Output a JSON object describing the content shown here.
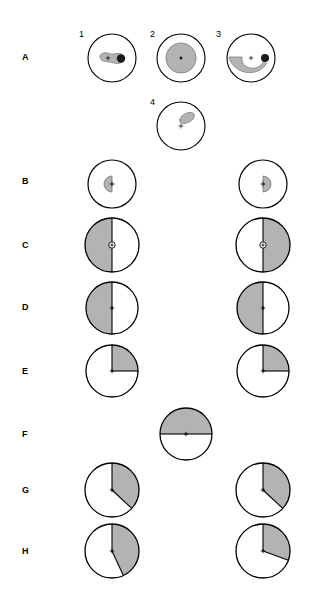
{
  "figure": {
    "background_color": "#ffffff",
    "outline_color": "#000000",
    "fill_gray": "#b3b3b3",
    "dot_color": "#1a1a1a",
    "width": 312,
    "height": 597
  },
  "row_labels": [
    {
      "id": "A",
      "label": "A",
      "y": 57
    },
    {
      "id": "B",
      "label": "B",
      "y": 181
    },
    {
      "id": "C",
      "label": "C",
      "y": 245
    },
    {
      "id": "D",
      "label": "D",
      "y": 307
    },
    {
      "id": "E",
      "label": "E",
      "y": 371
    },
    {
      "id": "F",
      "label": "F",
      "y": 434
    },
    {
      "id": "G",
      "label": "G",
      "y": 490
    },
    {
      "id": "H",
      "label": "H",
      "y": 551
    }
  ],
  "panel_numbers": [
    {
      "label": "1",
      "x": 79,
      "y": 30
    },
    {
      "label": "2",
      "x": 150,
      "y": 30
    },
    {
      "label": "3",
      "x": 216,
      "y": 30
    },
    {
      "label": "4",
      "x": 150,
      "y": 98
    }
  ],
  "chart_data": {
    "type": "diagram",
    "gray_fill": "#b3b3b3",
    "panels": [
      {
        "row": "A",
        "column": "1",
        "number": "1",
        "cx": 112,
        "cy": 58,
        "r": 24,
        "shape": "blob-with-dot",
        "fill_fraction": 0.09,
        "notes": "Tadpole / comet shaped gray blob with black dot at right end; center cross marker"
      },
      {
        "row": "A",
        "column": "2",
        "number": "2",
        "cx": 181,
        "cy": 58,
        "r": 24,
        "shape": "concentric-disc",
        "fill_fraction": 0.42,
        "notes": "Large gray disc concentric with outline; center dot"
      },
      {
        "row": "A",
        "column": "3",
        "number": "3",
        "cx": 251,
        "cy": 58,
        "r": 24,
        "shape": "crescent-with-dot",
        "fill_fraction": 0.22,
        "notes": "Gray crescent arc sweeping lower-left to right; black dot at right; center cross"
      },
      {
        "row": "A",
        "column": "4",
        "number": "4",
        "cx": 181,
        "cy": 126,
        "r": 24,
        "shape": "small-tilted-ellipse",
        "fill_fraction": 0.07,
        "notes": "Small tilted gray ellipse upper-right of center cross"
      },
      {
        "row": "B",
        "column": "left",
        "number": "",
        "cx": 112,
        "cy": 184,
        "r": 24,
        "shape": "small-half-disc-left",
        "start_deg": 180,
        "end_deg": 360,
        "inner_r": 8,
        "fill_fraction": 0.03,
        "notes": "Small gray semicircle opening right, at center"
      },
      {
        "row": "B",
        "column": "right",
        "number": "",
        "cx": 263,
        "cy": 184,
        "r": 24,
        "shape": "small-half-disc-right",
        "start_deg": 0,
        "end_deg": 180,
        "inner_r": 8,
        "fill_fraction": 0.03,
        "notes": "Small gray semicircle opening left, at center"
      },
      {
        "row": "C",
        "column": "left",
        "number": "",
        "cx": 112,
        "cy": 245,
        "r": 27,
        "shape": "half-disc-left",
        "start_deg": 180,
        "end_deg": 360,
        "fill_fraction": 0.5,
        "center_hole": true,
        "notes": "Left half gray, small white circle at center"
      },
      {
        "row": "C",
        "column": "right",
        "number": "",
        "cx": 263,
        "cy": 245,
        "r": 27,
        "shape": "half-disc-right",
        "start_deg": 0,
        "end_deg": 180,
        "fill_fraction": 0.5,
        "center_hole": true,
        "notes": "Right half gray, small white circle at center"
      },
      {
        "row": "D",
        "column": "left",
        "number": "",
        "cx": 112,
        "cy": 308,
        "r": 26,
        "shape": "half-disc-left",
        "start_deg": 180,
        "end_deg": 360,
        "fill_fraction": 0.5,
        "center_hole": false,
        "notes": "Left half gray, center cross only"
      },
      {
        "row": "D",
        "column": "right",
        "number": "",
        "cx": 263,
        "cy": 308,
        "r": 26,
        "shape": "half-disc-left",
        "start_deg": 180,
        "end_deg": 360,
        "fill_fraction": 0.5,
        "center_hole": false,
        "notes": "Left half gray, center cross only"
      },
      {
        "row": "E",
        "column": "left",
        "number": "",
        "cx": 112,
        "cy": 371,
        "r": 26,
        "shape": "quadrant-upper-right",
        "start_deg": 0,
        "end_deg": 90,
        "fill_fraction": 0.25,
        "notes": "Upper-right quadrant gray"
      },
      {
        "row": "E",
        "column": "right",
        "number": "",
        "cx": 263,
        "cy": 371,
        "r": 26,
        "shape": "quadrant-upper-right",
        "start_deg": 0,
        "end_deg": 90,
        "fill_fraction": 0.25,
        "notes": "Upper-right quadrant gray"
      },
      {
        "row": "F",
        "column": "center",
        "number": "",
        "cx": 186,
        "cy": 434,
        "r": 26,
        "shape": "half-disc-top",
        "start_deg": 270,
        "end_deg": 450,
        "fill_fraction": 0.5,
        "notes": "Top half gray"
      },
      {
        "row": "G",
        "column": "left",
        "number": "",
        "cx": 112,
        "cy": 490,
        "r": 27,
        "shape": "sector",
        "start_deg": 0,
        "end_deg": 133,
        "fill_fraction": 0.37,
        "notes": "Sector from 12 o'clock clockwise to lower-right"
      },
      {
        "row": "G",
        "column": "right",
        "number": "",
        "cx": 263,
        "cy": 490,
        "r": 27,
        "shape": "sector",
        "start_deg": 0,
        "end_deg": 133,
        "fill_fraction": 0.37,
        "notes": "Sector from 12 o'clock clockwise to lower-right"
      },
      {
        "row": "H",
        "column": "left",
        "number": "",
        "cx": 112,
        "cy": 551,
        "r": 27,
        "shape": "sector",
        "start_deg": 0,
        "end_deg": 155,
        "fill_fraction": 0.43,
        "notes": "Sector from 12 o'clock clockwise past 3 o'clock"
      },
      {
        "row": "H",
        "column": "right",
        "number": "",
        "cx": 263,
        "cy": 551,
        "r": 27,
        "shape": "sector",
        "start_deg": 0,
        "end_deg": 110,
        "fill_fraction": 0.31,
        "notes": "Sector from 12 o'clock clockwise to just past 3 o'clock"
      }
    ]
  },
  "caption": {
    "text": ""
  }
}
